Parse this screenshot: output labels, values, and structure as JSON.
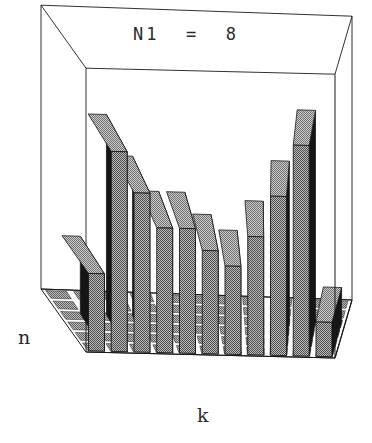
{
  "figure": {
    "title": "N1  =  8",
    "background_color": "#ffffff",
    "line_color": "#1a1a1a",
    "bar_face_color": "#9a9a9a",
    "bar_side_color": "#151515",
    "bar_top_color": "#b4b4b4",
    "floor_cell_color": "#9c9c9c"
  },
  "axes": {
    "depth_label": "n",
    "horizontal_label": "k"
  },
  "chart_data": {
    "type": "bar",
    "title": "N1  =  8",
    "xlabel": "k",
    "ylabel": "n",
    "zlabel": "",
    "projection": "3d",
    "grid": true,
    "legend": null,
    "categories": [
      "1",
      "2",
      "3",
      "4",
      "5",
      "6",
      "7",
      "8",
      "9",
      "10",
      "11"
    ],
    "values": [
      0.36,
      0.93,
      0.74,
      0.58,
      0.58,
      0.48,
      0.41,
      0.55,
      0.74,
      0.98,
      0.16
    ],
    "xlim": [
      0,
      11
    ],
    "ylim": [
      0,
      6
    ],
    "zlim": [
      0,
      1
    ],
    "floor_columns": 11,
    "floor_rows": 6,
    "tick_labels_x": [],
    "tick_labels_y": [],
    "tick_labels_z": []
  }
}
